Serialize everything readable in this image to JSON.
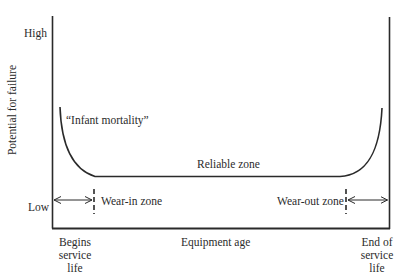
{
  "diagram": {
    "type": "bathtub curve",
    "y_axis": {
      "label": "Potential for failure",
      "high_label": "High",
      "low_label": "Low"
    },
    "x_axis": {
      "label": "Equipment age",
      "start_label_lines": [
        "Begins",
        "service",
        "life"
      ],
      "end_label_lines": [
        "End of",
        "service",
        "life"
      ]
    },
    "annotations": {
      "infant_mortality": "“Infant mortality”",
      "reliable_zone": "Reliable zone",
      "wear_in_zone": "Wear-in zone",
      "wear_out_zone": "Wear-out zone"
    },
    "colors": {
      "line": "#2a2a2a",
      "background": "#ffffff"
    }
  }
}
